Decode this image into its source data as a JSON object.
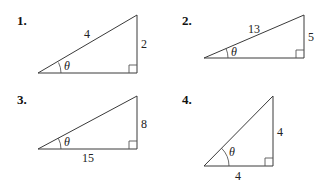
{
  "problems": [
    {
      "number": "1.",
      "hypotenuse_label": "4",
      "vertical_label": "2",
      "horizontal_label": "",
      "angle_label": "θ",
      "vertices": {
        "left": [
          38,
          73
        ],
        "right": [
          137,
          73
        ],
        "top": [
          137,
          15
        ]
      }
    },
    {
      "number": "2.",
      "hypotenuse_label": "13",
      "vertical_label": "5",
      "horizontal_label": "",
      "angle_label": "θ",
      "vertices": {
        "left": [
          204,
          58
        ],
        "right": [
          304,
          58
        ],
        "top": [
          304,
          15
        ]
      }
    },
    {
      "number": "3.",
      "hypotenuse_label": "",
      "vertical_label": "8",
      "horizontal_label": "15",
      "angle_label": "θ",
      "vertices": {
        "left": [
          38,
          149
        ],
        "right": [
          137,
          149
        ],
        "top": [
          137,
          96
        ]
      }
    },
    {
      "number": "4.",
      "hypotenuse_label": "",
      "vertical_label": "4",
      "horizontal_label": "4",
      "angle_label": "θ",
      "vertices": {
        "left": [
          204,
          166
        ],
        "right": [
          273,
          166
        ],
        "top": [
          273,
          96
        ]
      }
    }
  ]
}
